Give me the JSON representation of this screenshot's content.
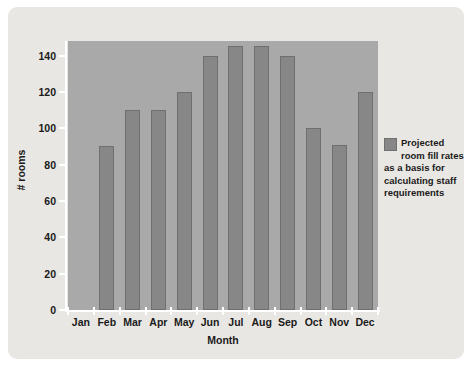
{
  "chart_data": {
    "type": "bar",
    "title": "",
    "subtitle": "",
    "xlabel": "Month",
    "ylabel": "# rooms",
    "categories": [
      "Jan",
      "Feb",
      "Mar",
      "Apr",
      "May",
      "Jun",
      "Jul",
      "Aug",
      "Sep",
      "Oct",
      "Nov",
      "Dec"
    ],
    "values": [
      0,
      90,
      110,
      110,
      120,
      140,
      145,
      145,
      140,
      100,
      91,
      120
    ],
    "series": [
      {
        "name": "Projected room fill rates as a basis for calculating staff requirements",
        "values": [
          0,
          90,
          110,
          110,
          120,
          140,
          145,
          145,
          140,
          100,
          91,
          120
        ]
      }
    ],
    "ylim": [
      0,
      148
    ],
    "xlim_note": "categorical",
    "ytick_labels": [
      "0",
      "20",
      "40",
      "60",
      "80",
      "100",
      "120",
      "140"
    ],
    "ytick_values": [
      0,
      20,
      40,
      60,
      80,
      100,
      120,
      140
    ],
    "grid": false,
    "legend_position": "right",
    "legend_entries": [
      {
        "label": "Projected room fill rates as a basis for calculating staff requirements",
        "color": "#878787"
      }
    ],
    "annotations": []
  },
  "colors": {
    "page_background": "#ffffff",
    "card_background": "#e9e7e3",
    "plot_background": "#a9a9a9",
    "bar_fill": "#878787",
    "bar_stroke": "#6f6f6f",
    "axis_line": "#ffffff",
    "text": "#1a1a1a"
  },
  "axes": {
    "y_title": "# rooms",
    "x_title": "Month"
  },
  "legend": {
    "swatch_name": "legend-color-swatch",
    "text": "Projected room fill rates as a basis for calculating staff requirements"
  }
}
